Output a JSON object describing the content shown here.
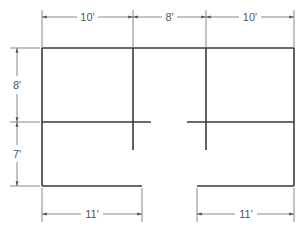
{
  "diagram": {
    "type": "floor-plan",
    "units": "feet",
    "dimensions": {
      "top": [
        {
          "id": "top-left",
          "label": "10'",
          "value": 10
        },
        {
          "id": "top-middle",
          "label": "8'",
          "value": 8
        },
        {
          "id": "top-right",
          "label": "10'",
          "value": 10
        }
      ],
      "left": [
        {
          "id": "left-upper",
          "label": "8'",
          "value": 8
        },
        {
          "id": "left-lower",
          "label": "7'",
          "value": 7
        }
      ],
      "bottom": [
        {
          "id": "bottom-left",
          "label": "11'",
          "value": 11
        },
        {
          "id": "bottom-right",
          "label": "11'",
          "value": 11
        }
      ]
    },
    "colors": {
      "wall": "#3a3a3a",
      "dimension": "#6a6a6a",
      "background": "#ffffff"
    }
  }
}
